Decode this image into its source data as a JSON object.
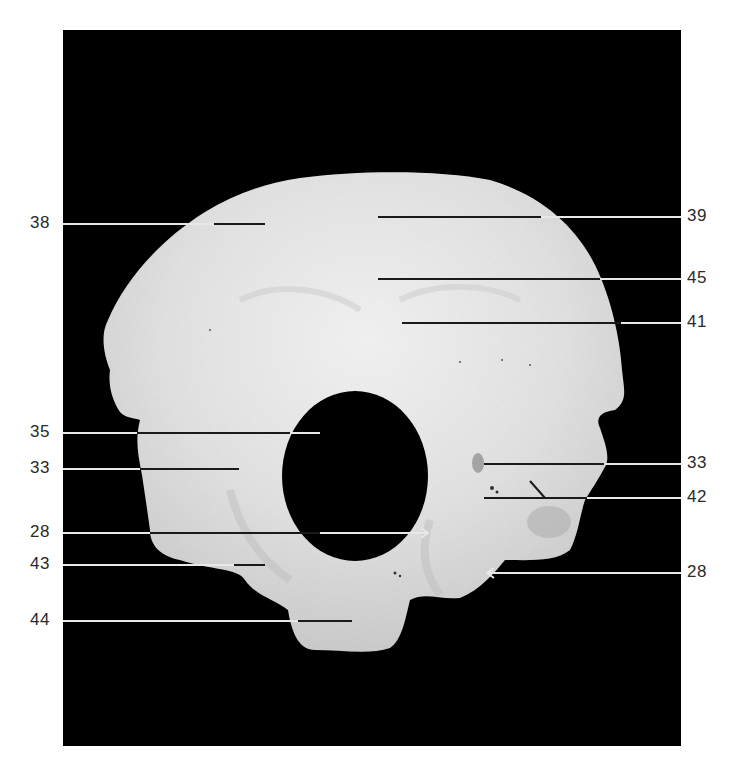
{
  "figure": {
    "background_panel_color": "#000000",
    "bone_color": "#e6e6e6",
    "labels_left": [
      {
        "text": "38",
        "y": 224,
        "line_start_x": 63,
        "line_end_x": 265,
        "bone_entry_x": 214,
        "pointer": "line"
      },
      {
        "text": "35",
        "y": 433,
        "line_start_x": 63,
        "line_end_x": 320,
        "bone_entry_x": 137,
        "pointer": "line"
      },
      {
        "text": "33",
        "y": 469,
        "line_start_x": 63,
        "line_end_x": 239,
        "bone_entry_x": 140,
        "pointer": "line"
      },
      {
        "text": "28",
        "y": 533,
        "line_start_x": 63,
        "line_end_x": 428,
        "bone_entry_x": 150,
        "pointer": "arrow-right"
      },
      {
        "text": "43",
        "y": 565,
        "line_start_x": 63,
        "line_end_x": 265,
        "bone_entry_x": 234,
        "pointer": "line"
      },
      {
        "text": "44",
        "y": 621,
        "line_start_x": 63,
        "line_end_x": 352,
        "bone_entry_x": 298,
        "pointer": "line"
      }
    ],
    "labels_right": [
      {
        "text": "39",
        "y": 217,
        "line_start_x": 378,
        "line_end_x": 681,
        "bone_exit_x": 541,
        "pointer": "line"
      },
      {
        "text": "45",
        "y": 279,
        "line_start_x": 378,
        "line_end_x": 681,
        "bone_exit_x": 600,
        "pointer": "line"
      },
      {
        "text": "41",
        "y": 323,
        "line_start_x": 402,
        "line_end_x": 681,
        "bone_exit_x": 621,
        "pointer": "line"
      },
      {
        "text": "33",
        "y": 464,
        "line_start_x": 484,
        "line_end_x": 681,
        "bone_exit_x": 604,
        "pointer": "line"
      },
      {
        "text": "42",
        "y": 498,
        "line_start_x": 484,
        "line_end_x": 681,
        "bone_exit_x": 587,
        "pointer": "line",
        "branch": {
          "x1": 530,
          "y1": 481,
          "x2": 545,
          "y2": 498
        }
      },
      {
        "text": "28",
        "y": 573,
        "line_start_x": 487,
        "line_end_x": 681,
        "bone_exit_x": 487,
        "pointer": "arrow-left"
      }
    ]
  }
}
